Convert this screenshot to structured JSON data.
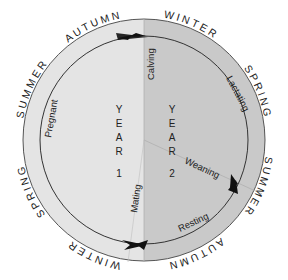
{
  "diagram": {
    "colors": {
      "year1_fill": "#e4e4e4",
      "year2_fill": "#c9c9c9",
      "outline": "#555555",
      "cycle_line": "#333333",
      "text": "#222222",
      "background": "#ffffff"
    },
    "seasons_outer": {
      "top_left": "AUTUMN",
      "upper_left": "SUMMER",
      "lower_left": "SPRING",
      "bottom_left": "WINTER",
      "top_right": "WINTER",
      "upper_right": "SPRING",
      "lower_right": "SUMMER",
      "bottom_right": "AUTUMN"
    },
    "phases": {
      "calving": "Calving",
      "lactating": "Lactating",
      "weaning": "Weaning",
      "resting": "Resting",
      "mating": "Mating",
      "pregnant": "Pregnant"
    },
    "years": [
      {
        "label_letters": [
          "Y",
          "E",
          "A",
          "R"
        ],
        "number": "1"
      },
      {
        "label_letters": [
          "Y",
          "E",
          "A",
          "R"
        ],
        "number": "2"
      }
    ],
    "markers": [
      {
        "name": "calving-arrow",
        "position": "top"
      },
      {
        "name": "weaning-arrow",
        "position": "lower-right"
      },
      {
        "name": "mating-arrow",
        "position": "bottom"
      }
    ]
  }
}
